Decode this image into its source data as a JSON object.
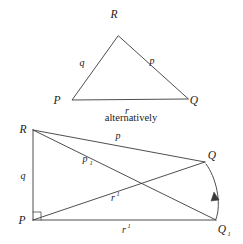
{
  "figure": {
    "caption_between": "alternatively",
    "stroke_color": "#3a3a3a",
    "text_color": "#1a1a1a",
    "background_color": "#ffffff",
    "top_triangle": {
      "name": "spherical-triangle-PQR",
      "vertices": [
        {
          "label": "R",
          "x": 118,
          "y": 36,
          "label_x": 114,
          "label_y": 18
        },
        {
          "label": "P",
          "x": 72,
          "y": 100,
          "label_x": 57,
          "label_y": 104
        },
        {
          "label": "Q",
          "x": 188,
          "y": 99,
          "label_x": 193,
          "label_y": 104
        }
      ],
      "sides": [
        {
          "label": "q",
          "label_x": 82,
          "label_y": 66
        },
        {
          "label": "p",
          "label_x": 152,
          "label_y": 64
        },
        {
          "label": "r",
          "label_x": 127,
          "label_y": 114
        }
      ]
    },
    "bottom_figure": {
      "name": "alternative-construction",
      "vertices": [
        {
          "label": "R",
          "x": 33,
          "y": 130,
          "label_x": 23,
          "label_y": 130
        },
        {
          "label": "P",
          "x": 33,
          "y": 220,
          "label_x": 22,
          "label_y": 223
        },
        {
          "label": "Q",
          "x": 205,
          "y": 162,
          "label_x": 211,
          "label_y": 160
        },
        {
          "label": "Q",
          "sub": "1",
          "x": 216,
          "y": 220,
          "label_x": 220,
          "label_y": 228
        }
      ],
      "sides": [
        {
          "label": "p",
          "label_x": 118,
          "label_y": 139
        },
        {
          "label": "p",
          "sub": "1",
          "label_x": 85,
          "label_y": 162
        },
        {
          "label": "q",
          "label_x": 23,
          "label_y": 176
        },
        {
          "label": "r",
          "sub": "1",
          "label_x": 113,
          "label_y": 198
        },
        {
          "label": "r",
          "sub": "1",
          "label_x": 124,
          "label_y": 231
        }
      ],
      "right_angle_marker": {
        "at": "P",
        "x": 33,
        "y": 220,
        "size": 8
      },
      "arc_arrow": {
        "from": "Q1",
        "to": "Q",
        "direction": "up"
      }
    }
  }
}
